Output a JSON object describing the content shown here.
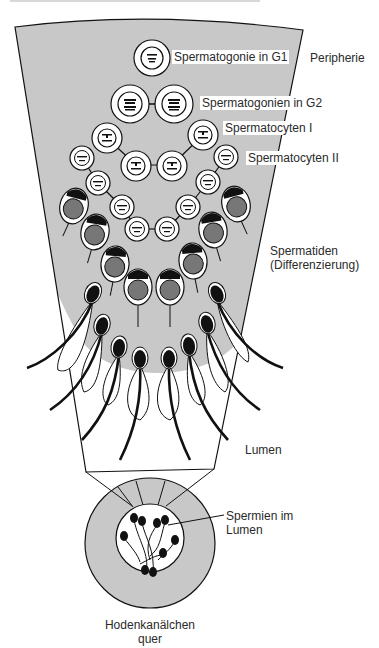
{
  "figure": {
    "labels": {
      "g1": "Spermatogonie in G1",
      "periphery": "Peripherie",
      "g2": "Spermatogonien in G2",
      "spermatocytes1": "Spermatocyten I",
      "spermatocytes2": "Spermatocyten II",
      "spermatids_line1": "Spermatiden",
      "spermatids_line2": "(Differenzierung)",
      "lumen": "Lumen",
      "sperm_lumen_line1": "Spermien im",
      "sperm_lumen_line2": "Lumen",
      "tubule_line1": "Hodenkanälchen",
      "tubule_line2": "quer"
    },
    "colors": {
      "epithelium": "#c8c8c8",
      "nucleus_grey": "#777777",
      "outline": "#111111",
      "background": "#ffffff"
    }
  }
}
